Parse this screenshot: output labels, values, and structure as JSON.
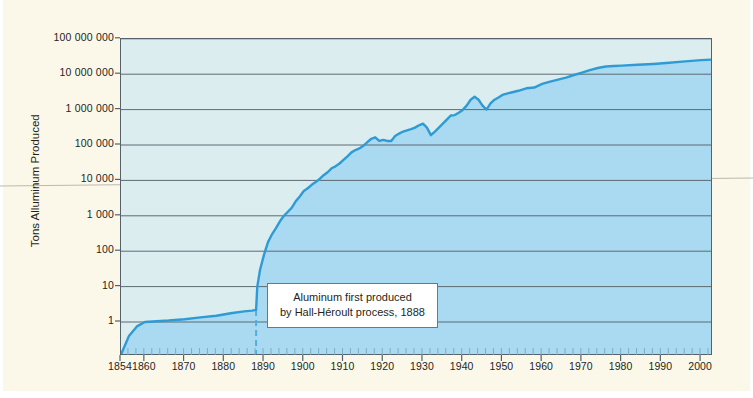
{
  "figure": {
    "background_color": "#fbf8e9",
    "plot_background_color": "#dcedf0"
  },
  "annotation": {
    "line1": "Aluminum first produced",
    "line2": "by Hall-Héroult process, 1888",
    "marker_year": 1888
  },
  "chart_data": {
    "type": "area",
    "title": "",
    "subtitle": "",
    "xlabel": "",
    "ylabel": "Tons Alluminum Produced",
    "xlim": [
      1854,
      2003
    ],
    "ylim": [
      0.1,
      100000000
    ],
    "yscale": "log",
    "grid": true,
    "legend": null,
    "colors": {
      "line": "#2f9bd4",
      "fill_below": "#a9daf2",
      "fill_above": "#dcedf0",
      "axis": "#55626b",
      "gridline": "#5d6a72",
      "marker_line": "#4fb0de",
      "text": "#241f1c"
    },
    "xticks": [
      1854,
      1860,
      1870,
      1880,
      1890,
      1900,
      1910,
      1920,
      1930,
      1940,
      1950,
      1960,
      1970,
      1980,
      1990,
      2000
    ],
    "xtick_labels": [
      "1854",
      "1860",
      "1870",
      "1880",
      "1890",
      "1900",
      "1910",
      "1920",
      "1930",
      "1940",
      "1950",
      "1960",
      "1970",
      "1980",
      "1990",
      "2000"
    ],
    "yticks": [
      1,
      10,
      100,
      1000,
      10000,
      100000,
      1000000,
      10000000,
      100000000
    ],
    "ytick_labels": [
      "1",
      "10",
      "100",
      "1 000",
      "10 000",
      "100 000",
      "1 000 000",
      "10 000 000",
      "100 000 000"
    ],
    "series": [
      {
        "name": "Tons Aluminum Produced",
        "x": [
          1854,
          1856,
          1858,
          1860,
          1863,
          1866,
          1870,
          1874,
          1878,
          1882,
          1885,
          1887,
          1888,
          1888.3,
          1889,
          1890,
          1891,
          1892,
          1893,
          1894,
          1895,
          1896,
          1897,
          1898,
          1899,
          1900,
          1901,
          1902,
          1903,
          1904,
          1905,
          1906,
          1907,
          1908,
          1909,
          1910,
          1911,
          1912,
          1913,
          1914,
          1915,
          1916,
          1917,
          1918,
          1919,
          1920,
          1921,
          1922,
          1923,
          1924,
          1925,
          1926,
          1927,
          1928,
          1929,
          1930,
          1931,
          1932,
          1933,
          1934,
          1935,
          1936,
          1937,
          1938,
          1939,
          1940,
          1941,
          1942,
          1943,
          1944,
          1945,
          1946,
          1947,
          1948,
          1949,
          1950,
          1952,
          1954,
          1956,
          1958,
          1960,
          1962,
          1964,
          1966,
          1968,
          1970,
          1972,
          1974,
          1976,
          1978,
          1980,
          1984,
          1988,
          1992,
          1996,
          2000,
          2003
        ],
        "y": [
          0.12,
          0.4,
          0.75,
          1.0,
          1.05,
          1.1,
          1.2,
          1.35,
          1.5,
          1.8,
          2.0,
          2.1,
          2.2,
          10,
          30,
          80,
          180,
          300,
          450,
          700,
          1000,
          1300,
          1700,
          2600,
          3500,
          5000,
          6000,
          7500,
          9000,
          11000,
          14000,
          17000,
          22000,
          25000,
          30000,
          38000,
          48000,
          62000,
          72000,
          80000,
          95000,
          120000,
          150000,
          165000,
          130000,
          140000,
          130000,
          130000,
          180000,
          210000,
          240000,
          260000,
          280000,
          310000,
          360000,
          400000,
          310000,
          190000,
          240000,
          310000,
          400000,
          520000,
          680000,
          700000,
          820000,
          980000,
          1300000,
          1900000,
          2300000,
          1900000,
          1300000,
          1000000,
          1500000,
          1900000,
          2200000,
          2600000,
          3000000,
          3400000,
          4000000,
          4200000,
          5300000,
          6200000,
          7000000,
          8000000,
          9500000,
          11000000,
          13000000,
          15000000,
          16500000,
          17000000,
          17500000,
          18500000,
          19500000,
          21000000,
          23000000,
          25000000,
          26000000
        ]
      }
    ]
  }
}
